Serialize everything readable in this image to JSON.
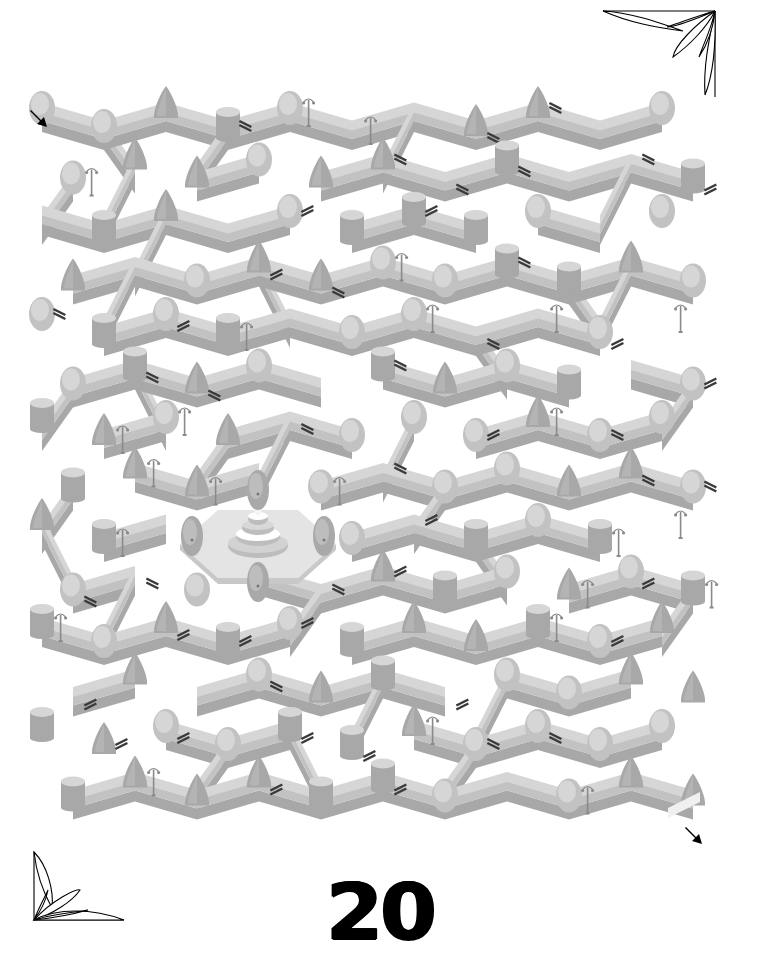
{
  "page": {
    "type": "maze-puzzle",
    "page_number": "20",
    "start_label": "start",
    "end_label": "finish"
  },
  "colors": {
    "background": "#ffffff",
    "hedge_light": "#d6d6d6",
    "hedge_mid": "#c2c2c2",
    "hedge_dark": "#a8a8a8",
    "hedge_shadow": "#b4b4b4",
    "bench": "#3a3a3a",
    "lamp": "#8a8a8a",
    "fountain": "#efefef",
    "arrow": "#000000",
    "ornament_stroke": "#000000"
  },
  "maze": {
    "rows": 14,
    "cols": 11,
    "origin": [
      42,
      118
    ],
    "cell_w": 62,
    "row_h": 51.5,
    "centerpiece": "fountain-plaza",
    "centerpiece_center": [
      258,
      538
    ],
    "entrance": "top-left",
    "exit": "bottom-right",
    "decor_kinds": [
      "round-bush",
      "cone-tree",
      "cylinder-hedge",
      "bench",
      "street-lamp"
    ]
  },
  "icons": {
    "start_arrow": "arrow-down-right-icon",
    "end_arrow": "arrow-down-right-icon",
    "corner_top_right": "leaf-corner-ornament-icon",
    "corner_bottom_left": "leaf-corner-ornament-icon"
  }
}
